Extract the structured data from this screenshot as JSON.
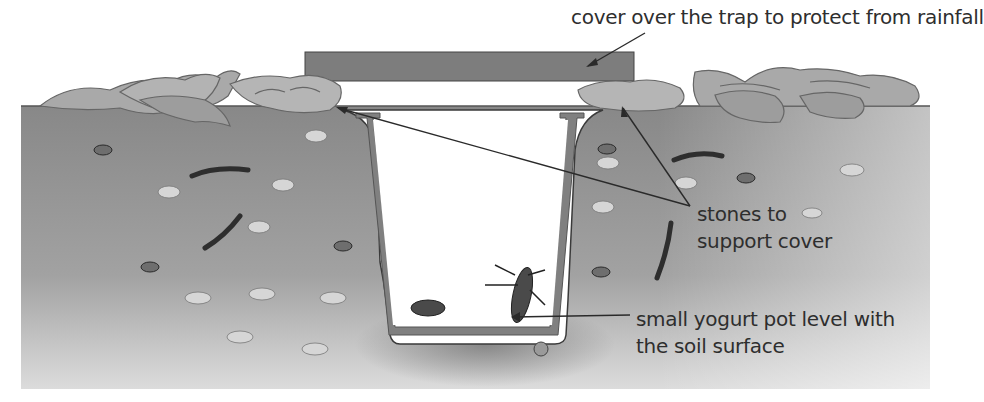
{
  "diagram": {
    "type": "pitfall-trap-cross-section",
    "colors": {
      "soil": "#8e8e8e",
      "soil_light": "#c9c9c9",
      "cover": "#7d7d7d",
      "pot_wall": "#808080",
      "leaves": "#a9a9a9",
      "stone": "#d4d4d4",
      "text": "#2e2e2e",
      "line": "#2a2a2a"
    },
    "labels": {
      "cover": "cover over the trap to protect from rainfall",
      "stones_line1": "stones to",
      "stones_line2": "support cover",
      "pot_line1": "small yogurt pot level with",
      "pot_line2": "the soil surface"
    },
    "elements": {
      "cover": "flat cover board",
      "stones": "stones",
      "pot": "yogurt pot",
      "soil": "soil",
      "leaf_litter": "leaf litter",
      "invertebrates": [
        "beetle",
        "larva",
        "woodlice",
        "worms",
        "snail"
      ]
    }
  }
}
